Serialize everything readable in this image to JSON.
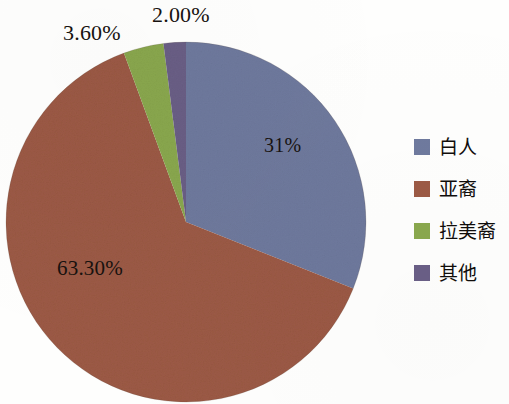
{
  "chart_data": {
    "type": "pie",
    "title": "",
    "subtitle": "",
    "xlabel": "",
    "ylabel": "",
    "legend_position": "right",
    "grid": false,
    "categories": [
      "白人",
      "亚裔",
      "拉美裔",
      "其他"
    ],
    "values": [
      31.0,
      63.3,
      3.6,
      2.0
    ],
    "data_labels": [
      "31%",
      "63.30%",
      "3.60%",
      "2.00%"
    ],
    "colors": [
      "#6f7a9e",
      "#9c5a45",
      "#8aa84e",
      "#6a5f86"
    ],
    "slices": [
      {
        "name": "白人",
        "value": 31.0,
        "label": "31%",
        "color": "#6f7a9e",
        "label_placement": "inside"
      },
      {
        "name": "亚裔",
        "value": 63.3,
        "label": "63.30%",
        "color": "#9c5a45",
        "label_placement": "inside"
      },
      {
        "name": "拉美裔",
        "value": 3.6,
        "label": "3.60%",
        "color": "#8aa84e",
        "label_placement": "outside"
      },
      {
        "name": "其他",
        "value": 2.0,
        "label": "2.00%",
        "color": "#6a5f86",
        "label_placement": "outside"
      }
    ],
    "start_angle_deg": 0,
    "direction": "clockwise"
  },
  "labels": {
    "white_pct": "31%",
    "asian_pct": "63.30%",
    "hispanic_pct": "3.60%",
    "other_pct": "2.00%"
  },
  "legend": {
    "items": [
      {
        "label": "白人",
        "color": "#6f7a9e"
      },
      {
        "label": "亚裔",
        "color": "#9c5a45"
      },
      {
        "label": "拉美裔",
        "color": "#8aa84e"
      },
      {
        "label": "其他",
        "color": "#6a5f86"
      }
    ]
  }
}
